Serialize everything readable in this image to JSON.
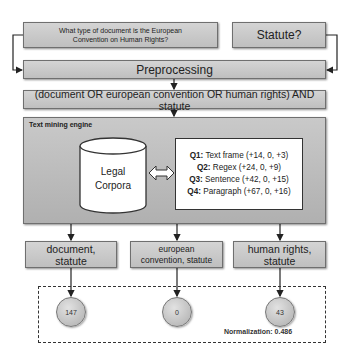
{
  "diagram": {
    "inputs": {
      "question": "What type of document is the European Convention on Human Rights?",
      "category": "Statute?"
    },
    "preprocessing_label": "Preprocessing",
    "query": "(document OR european convention OR human rights) AND statute",
    "engine": {
      "label": "Text mining engine",
      "corpus_label_line1": "Legal",
      "corpus_label_line2": "Corpora",
      "queries": [
        {
          "id": "Q1:",
          "text": " Text frame (+14, 0, +3)"
        },
        {
          "id": "Q2:",
          "text": " Regex (+24, 0, +9)"
        },
        {
          "id": "Q3:",
          "text": " Sentence (+42, 0, +15)"
        },
        {
          "id": "Q4:",
          "text": " Paragraph (+67, 0, +16)"
        }
      ]
    },
    "results": [
      {
        "line1": "document,",
        "line2": "statute",
        "count": "147"
      },
      {
        "line1": "european",
        "line2": "convention, statute",
        "count": "0"
      },
      {
        "line1": "human rights,",
        "line2": "statute",
        "count": "43"
      }
    ],
    "normalization": "Normalization: 0.486",
    "icons": {
      "corpus": "database-cylinder-icon",
      "link": "double-arrow-icon",
      "flow": "arrow-down-icon"
    }
  }
}
